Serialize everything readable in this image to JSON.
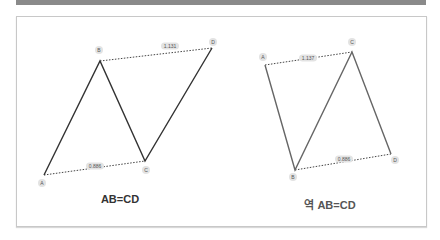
{
  "header_bar": {
    "color": "#8a8a8a"
  },
  "diagrams": [
    {
      "caption": "AB=CD",
      "line_color": "#333333",
      "points": [
        {
          "label": "A",
          "x": 44,
          "y": 175,
          "lx": 42,
          "ly": 183
        },
        {
          "label": "B",
          "x": 100,
          "y": 61,
          "lx": 99,
          "ly": 50
        },
        {
          "label": "C",
          "x": 145,
          "y": 161,
          "lx": 146,
          "ly": 170
        },
        {
          "label": "D",
          "x": 212,
          "y": 48,
          "lx": 213,
          "ly": 42
        }
      ],
      "ratios": [
        {
          "text": "1.131",
          "from": "B",
          "to": "D",
          "x": 170,
          "y": 46
        },
        {
          "text": "0.886",
          "from": "A",
          "to": "C",
          "x": 95,
          "y": 166
        }
      ]
    },
    {
      "caption": "역 AB=CD",
      "line_color": "#666666",
      "points": [
        {
          "label": "A",
          "x": 265,
          "y": 65,
          "lx": 263,
          "ly": 57
        },
        {
          "label": "B",
          "x": 295,
          "y": 170,
          "lx": 293,
          "ly": 177
        },
        {
          "label": "C",
          "x": 352,
          "y": 52,
          "lx": 352,
          "ly": 42
        },
        {
          "label": "D",
          "x": 391,
          "y": 154,
          "lx": 395,
          "ly": 160
        }
      ],
      "ratios": [
        {
          "text": "1.137",
          "from": "A",
          "to": "C",
          "x": 308,
          "y": 58
        },
        {
          "text": "0.886",
          "from": "B",
          "to": "D",
          "x": 344,
          "y": 159
        }
      ]
    }
  ]
}
